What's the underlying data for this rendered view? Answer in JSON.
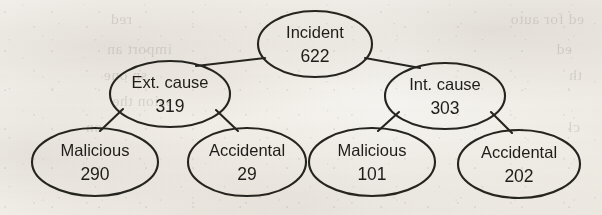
{
  "figure": {
    "ink_color": "#26241f",
    "paper_color": "#f5f3ef"
  },
  "chart_data": {
    "type": "diagram",
    "subtype": "tree",
    "title": "",
    "root": "Incident",
    "nodes": [
      {
        "id": "incident",
        "label": "Incident",
        "value": "622",
        "level": 0,
        "parent": null,
        "cx": 315,
        "cy": 44,
        "rx": 57,
        "ry": 33
      },
      {
        "id": "ext-cause",
        "label": "Ext. cause",
        "value": "319",
        "level": 1,
        "parent": "incident",
        "cx": 170,
        "cy": 94,
        "rx": 60,
        "ry": 33
      },
      {
        "id": "int-cause",
        "label": "Int. cause",
        "value": "303",
        "level": 1,
        "parent": "incident",
        "cx": 445,
        "cy": 96,
        "rx": 60,
        "ry": 33
      },
      {
        "id": "ext-malicious",
        "label": "Malicious",
        "value": "290",
        "level": 2,
        "parent": "ext-cause",
        "cx": 95,
        "cy": 162,
        "rx": 63,
        "ry": 34
      },
      {
        "id": "ext-accidental",
        "label": "Accidental",
        "value": "29",
        "level": 2,
        "parent": "ext-cause",
        "cx": 247,
        "cy": 162,
        "rx": 59,
        "ry": 34
      },
      {
        "id": "int-malicious",
        "label": "Malicious",
        "value": "101",
        "level": 2,
        "parent": "int-cause",
        "cx": 372,
        "cy": 162,
        "rx": 63,
        "ry": 34
      },
      {
        "id": "int-accidental",
        "label": "Accidental",
        "value": "202",
        "level": 2,
        "parent": "int-cause",
        "cx": 519,
        "cy": 164,
        "rx": 61,
        "ry": 34
      }
    ],
    "edges": [
      {
        "from": "incident",
        "to": "ext-cause",
        "x1": 265,
        "y1": 58,
        "x2": 196,
        "y2": 66
      },
      {
        "from": "incident",
        "to": "int-cause",
        "x1": 365,
        "y1": 58,
        "x2": 420,
        "y2": 68
      },
      {
        "from": "ext-cause",
        "to": "ext-malicious",
        "x1": 123,
        "y1": 109,
        "x2": 100,
        "y2": 131
      },
      {
        "from": "ext-cause",
        "to": "ext-accidental",
        "x1": 216,
        "y1": 110,
        "x2": 238,
        "y2": 131
      },
      {
        "from": "int-cause",
        "to": "int-malicious",
        "x1": 399,
        "y1": 112,
        "x2": 378,
        "y2": 131
      },
      {
        "from": "int-cause",
        "to": "int-accidental",
        "x1": 491,
        "y1": 112,
        "x2": 512,
        "y2": 133
      }
    ],
    "totals": {
      "incident": 622,
      "ext_cause": 319,
      "int_cause": 303,
      "ext_malicious": 290,
      "ext_accidental": 29,
      "int_malicious": 101,
      "int_accidental": 202
    }
  },
  "background_bleed": {
    "note": "faint mirrored show-through text from the reverse side of the scanned page",
    "lines": [
      {
        "text": "ed for auto",
        "x": 18,
        "y": 10
      },
      {
        "text": "red",
        "x": 470,
        "y": 10
      },
      {
        "text": "ed",
        "x": 30,
        "y": 40
      },
      {
        "text": "import an",
        "x": 430,
        "y": 40
      },
      {
        "text": "th",
        "x": 20,
        "y": 66
      },
      {
        "text": "sn one",
        "x": 455,
        "y": 66
      },
      {
        "text": "ssion the",
        "x": 430,
        "y": 92
      },
      {
        "text": "cl",
        "x": 22,
        "y": 118
      },
      {
        "text": "on",
        "x": 500,
        "y": 118
      }
    ]
  }
}
